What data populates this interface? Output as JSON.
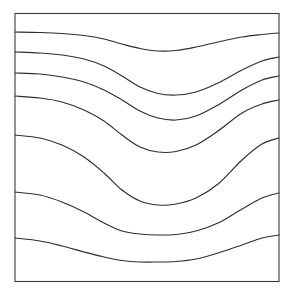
{
  "figure": {
    "background_color": "#ffffff",
    "line_color": "#2e2e2e",
    "frame_color": "#3a3a3a",
    "line_width": 1.15,
    "canvas": {
      "width": 296,
      "height": 298
    }
  },
  "frame": {
    "x": 15,
    "y": 13.5,
    "width": 264,
    "height": 268,
    "label": "diagram-border"
  },
  "chart_data": {
    "type": "line",
    "subtitle": "",
    "xlabel": "",
    "ylabel": "",
    "grid": false,
    "legend": null,
    "xlim": [
      15,
      279
    ],
    "ylim": [
      13.5,
      281.5
    ],
    "x": [
      15,
      40,
      62,
      84,
      104,
      122,
      140,
      158,
      176,
      196,
      218,
      242,
      262,
      279
    ],
    "series": [
      {
        "name": "stratum-1",
        "left_y": 32,
        "right_y": 33,
        "trough_x": 152,
        "trough_y": 51,
        "values": [
          32,
          32.5,
          33.5,
          35.5,
          39,
          44,
          48.5,
          51,
          50.5,
          47,
          42,
          37,
          34.5,
          33
        ]
      },
      {
        "name": "stratum-2",
        "left_y": 52,
        "right_y": 57,
        "trough_x": 152,
        "trough_y": 95,
        "values": [
          52,
          53,
          55,
          59,
          66,
          76,
          87,
          93.5,
          95,
          92,
          83,
          70,
          61,
          57
        ]
      },
      {
        "name": "stratum-3",
        "left_y": 73,
        "right_y": 76,
        "trough_x": 150,
        "trough_y": 120,
        "values": [
          73,
          74,
          77,
          82,
          90,
          100,
          111,
          118,
          120,
          116,
          105,
          90,
          80,
          76
        ]
      },
      {
        "name": "stratum-4",
        "left_y": 96,
        "right_y": 100,
        "trough_x": 150,
        "trough_y": 152,
        "values": [
          96,
          98,
          102,
          110,
          121,
          135,
          147,
          152,
          151.5,
          145,
          131,
          113,
          104,
          100
        ]
      },
      {
        "name": "stratum-5",
        "left_y": 135,
        "right_y": 138,
        "trough_x": 150,
        "trough_y": 205,
        "values": [
          135,
          138,
          145,
          157,
          173,
          190,
          201,
          205,
          204,
          198,
          184,
          160,
          144,
          138
        ]
      },
      {
        "name": "stratum-6",
        "left_y": 192,
        "right_y": 193,
        "trough_x": 150,
        "trough_y": 235,
        "values": [
          192,
          195,
          202,
          212,
          223,
          231,
          234,
          235,
          234.5,
          231,
          223,
          209,
          198,
          193
        ]
      },
      {
        "name": "stratum-7",
        "left_y": 238,
        "right_y": 235,
        "trough_x": 148,
        "trough_y": 262,
        "values": [
          238,
          241,
          246,
          252,
          257,
          260.5,
          262,
          262,
          261.5,
          259,
          253,
          245,
          238,
          235
        ]
      }
    ]
  }
}
